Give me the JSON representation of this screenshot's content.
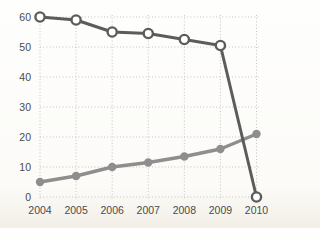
{
  "chart_data": {
    "type": "line",
    "title": "",
    "xlabel": "",
    "ylabel": "",
    "categories": [
      "2004",
      "2005",
      "2006",
      "2007",
      "2008",
      "2009",
      "2010"
    ],
    "series": [
      {
        "name": "declining-series-open-circles",
        "marker": "open-circle",
        "color": "#5c5c5c",
        "marker_fill": "#ffffff",
        "values": [
          60,
          59,
          55,
          54.5,
          52.5,
          50.5,
          0
        ]
      },
      {
        "name": "rising-series-filled-circles",
        "marker": "filled-circle",
        "color": "#8e8e8e",
        "marker_fill": "#8e8e8e",
        "values": [
          5,
          7,
          10,
          11.5,
          13.5,
          16,
          21
        ]
      }
    ],
    "ylim": [
      0,
      60
    ],
    "y_ticks": [
      0,
      10,
      20,
      30,
      40,
      50,
      60
    ],
    "grid": "dotted-both-axes",
    "grid_color": "#c4c4c4",
    "tick_label_color": "#4b4b4b",
    "legend": "none"
  }
}
